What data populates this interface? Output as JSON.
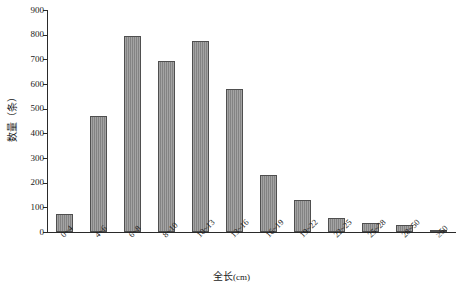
{
  "chart_data": {
    "type": "bar",
    "title": "",
    "xlabel": "全长(cm)",
    "xlabel_main": "全长",
    "xlabel_unit": "(cm)",
    "ylabel": "数量（条）",
    "categories": [
      "0~4",
      "4~6",
      "6~8",
      "8~10",
      "10~13",
      "13~16",
      "16~19",
      "19~22",
      "22~25",
      "25~28",
      "28~50",
      "≥50"
    ],
    "values": [
      75,
      470,
      795,
      695,
      775,
      580,
      230,
      130,
      55,
      35,
      30,
      5
    ],
    "ylim": [
      0,
      900
    ],
    "ytick_step": 100,
    "yticks": [
      0,
      100,
      200,
      300,
      400,
      500,
      600,
      700,
      800,
      900
    ],
    "ytick_labels": [
      "0",
      "100",
      "200",
      "300",
      "400",
      "500",
      "600",
      "700",
      "800",
      "900"
    ],
    "grid": false,
    "legend": null,
    "bar_color": "#8a8a8a",
    "bar_edge_color": "#4f4f4f",
    "axis_color": "#2a2a2a",
    "background": "#ffffff"
  }
}
